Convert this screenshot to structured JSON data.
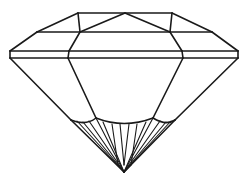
{
  "diagram": {
    "subject": "diamond-cut gemstone side profile",
    "line_color": "#1a1a1a",
    "background": "#ffffff",
    "parts": [
      "table",
      "crown",
      "girdle",
      "pavilion",
      "culet"
    ]
  }
}
